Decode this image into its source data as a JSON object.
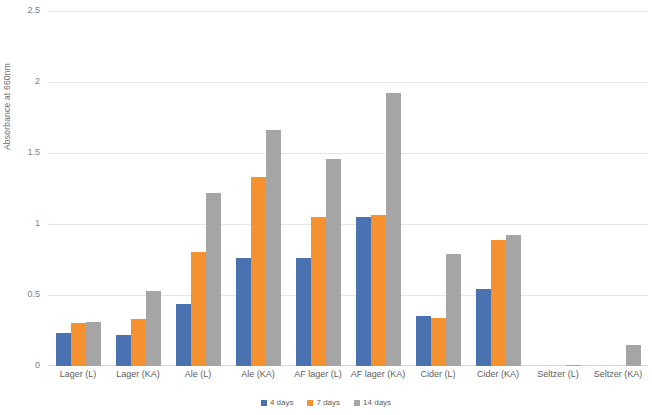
{
  "chart_data": {
    "type": "bar",
    "title": "",
    "xlabel": "",
    "ylabel": "Absorbance at 660nm",
    "ylim": [
      0,
      2.5
    ],
    "ytick_labels": [
      "2.5",
      "2",
      "1.5",
      "1",
      "0.5",
      "0"
    ],
    "ytick_values": [
      2.5,
      2,
      1.5,
      1,
      0.5,
      0
    ],
    "grid": true,
    "legend_position": "bottom",
    "categories": [
      "Lager (L)",
      "Lager (KA)",
      "Ale (L)",
      "Ale (KA)",
      "AF  lager (L)",
      "AF lager (KA)",
      "Cider (L)",
      "Cider (KA)",
      "Seltzer (L)",
      "Seltzer (KA)"
    ],
    "series": [
      {
        "name": "4 days",
        "color": "#4a72b0",
        "values": [
          0.23,
          0.22,
          0.44,
          0.76,
          0.76,
          1.05,
          0.35,
          0.54,
          0.0,
          0.0
        ]
      },
      {
        "name": "7 days",
        "color": "#f5922f",
        "values": [
          0.3,
          0.33,
          0.8,
          1.33,
          1.05,
          1.06,
          0.34,
          0.89,
          0.0,
          0.0
        ]
      },
      {
        "name": "14 days",
        "color": "#a5a5a5",
        "values": [
          0.31,
          0.53,
          1.22,
          1.66,
          1.46,
          1.92,
          0.79,
          0.92,
          0.01,
          0.15
        ]
      }
    ]
  }
}
